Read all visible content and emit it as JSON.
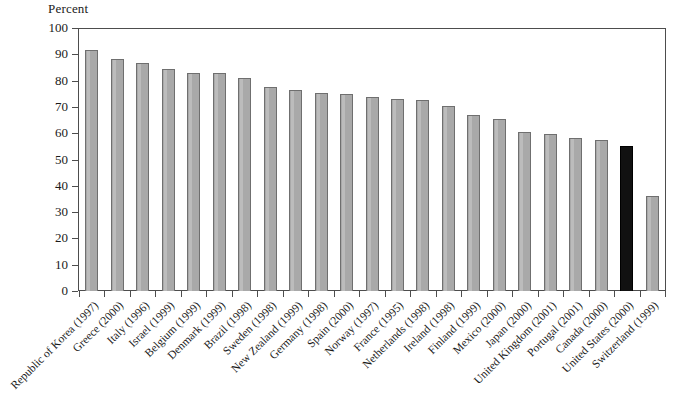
{
  "chart_data": {
    "type": "bar",
    "title": "",
    "subtitle": "",
    "xlabel": "",
    "ylabel": "Percent",
    "ylim": [
      0,
      100
    ],
    "ytick_step": 10,
    "yticks": [
      "100",
      "90",
      "80",
      "70",
      "60",
      "50",
      "40",
      "30",
      "20",
      "10",
      "0"
    ],
    "grid": false,
    "legend": "none",
    "bar_color": "#a9a9a9",
    "bar_edge_color": "#6f6f6f",
    "highlight_color": "#111111",
    "frame_color": "#4d4d4d",
    "categories": [
      "Republic of Korea (1997)",
      "Greece (2000)",
      "Italy (1996)",
      "Israel (1999)",
      "Belgium (1999)",
      "Denmark (1999)",
      "Brazil (1998)",
      "Sweden (1998)",
      "New Zealand (1999)",
      "Germany (1998)",
      "Spain (2000)",
      "Norway (1997)",
      "France (1995)",
      "Netherlands (1998)",
      "Ireland (1998)",
      "Finland (1999)",
      "Mexico (2000)",
      "Japan (2000)",
      "United Kingdom (2001)",
      "Portugal (2001)",
      "Canada (2000)",
      "United States (2000)",
      "Switzerland (1999)"
    ],
    "values": [
      92.5,
      89.0,
      87.5,
      85.0,
      83.5,
      83.5,
      81.5,
      78.0,
      77.0,
      76.0,
      75.5,
      74.5,
      73.5,
      73.0,
      71.0,
      67.5,
      66.0,
      61.0,
      60.0,
      58.5,
      58.0,
      55.5,
      36.5
    ],
    "highlight_index": 21,
    "highlight_category": "United States (2000)"
  }
}
